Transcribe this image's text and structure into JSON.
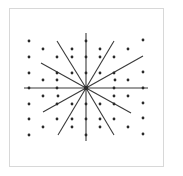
{
  "diagram": {
    "title": "",
    "center": [
      86,
      88
    ],
    "line_color": "#3a3a3a",
    "dot_color": "#2a2a2a",
    "frame_color": "#d8d8d8",
    "axes": [
      {
        "x1": 24,
        "y1": 88,
        "x2": 148,
        "y2": 88
      },
      {
        "x1": 86,
        "y1": 33,
        "x2": 86,
        "y2": 141
      }
    ],
    "rays": [
      {
        "x": 57,
        "y": 41
      },
      {
        "x": 114,
        "y": 41
      },
      {
        "x": 41,
        "y": 63
      },
      {
        "x": 143,
        "y": 56
      },
      {
        "x": 43,
        "y": 112
      },
      {
        "x": 131,
        "y": 113
      },
      {
        "x": 58,
        "y": 135
      },
      {
        "x": 114,
        "y": 135
      }
    ],
    "dots": [
      [
        29,
        41
      ],
      [
        86,
        41
      ],
      [
        143,
        40
      ],
      [
        43,
        49
      ],
      [
        72,
        49
      ],
      [
        100,
        49
      ],
      [
        128,
        49
      ],
      [
        29,
        57
      ],
      [
        57,
        57
      ],
      [
        114,
        57
      ],
      [
        29,
        73
      ],
      [
        72,
        73
      ],
      [
        100,
        73
      ],
      [
        143,
        72
      ],
      [
        43,
        80
      ],
      [
        128,
        80
      ],
      [
        29,
        88
      ],
      [
        57,
        88
      ],
      [
        114,
        88
      ],
      [
        143,
        88
      ],
      [
        43,
        96
      ],
      [
        128,
        96
      ],
      [
        29,
        104
      ],
      [
        72,
        104
      ],
      [
        100,
        104
      ],
      [
        143,
        103
      ],
      [
        29,
        119
      ],
      [
        57,
        119
      ],
      [
        114,
        119
      ],
      [
        143,
        118
      ],
      [
        43,
        127
      ],
      [
        72,
        127
      ],
      [
        100,
        127
      ],
      [
        128,
        127
      ],
      [
        29,
        135
      ],
      [
        86,
        135
      ],
      [
        143,
        134
      ],
      [
        86,
        57
      ],
      [
        86,
        73
      ],
      [
        86,
        104
      ],
      [
        86,
        119
      ],
      [
        57,
        73
      ],
      [
        114,
        73
      ],
      [
        57,
        104
      ],
      [
        114,
        104
      ],
      [
        72,
        57
      ],
      [
        100,
        57
      ],
      [
        72,
        119
      ],
      [
        100,
        119
      ],
      [
        58,
        96
      ],
      [
        115,
        80
      ],
      [
        57,
        80
      ],
      [
        114,
        96
      ]
    ]
  }
}
